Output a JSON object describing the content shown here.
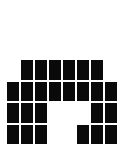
{
  "image": {
    "kind": "pixel-block-glyph",
    "title": "Pixel Block Glyph",
    "width": 124,
    "height": 147,
    "background_color": "#ffffff",
    "module_color": "#0a0a0a",
    "grid": {
      "columns": 8,
      "rows": 4,
      "module_width": 14,
      "module_height": 21.5,
      "offset_x": 6,
      "offset_y": 59
    },
    "modules": [
      [
        0,
        1,
        1,
        1,
        1,
        1,
        1,
        0
      ],
      [
        1,
        1,
        1,
        1,
        1,
        1,
        1,
        1
      ],
      [
        1,
        1,
        1,
        0,
        0,
        0,
        1,
        1
      ],
      [
        1,
        1,
        1,
        0,
        0,
        1,
        1,
        1
      ]
    ]
  }
}
